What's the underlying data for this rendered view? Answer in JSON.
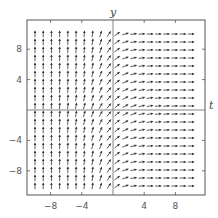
{
  "chart_data": {
    "type": "vector_field",
    "title": "",
    "xlabel": "t",
    "ylabel": "y",
    "xlim": [
      -11,
      11
    ],
    "ylim": [
      -11,
      11
    ],
    "xticks": [
      -8,
      -4,
      4,
      8
    ],
    "yticks": [
      -8,
      -4,
      4,
      8
    ],
    "xtick_labels": [
      "−8",
      "−4",
      "4",
      "8"
    ],
    "ytick_labels": [
      "−8",
      "−4",
      "4",
      "8"
    ],
    "grid": false,
    "legend": null,
    "field_description": "Slope/direction field: arrows nearly vertical (pointing up) for t < 0 far from y = 0, diagonal near t ≈ 0 and near y ≈ 0, nearly horizontal (pointing right) for t > 0 far from y = 0.",
    "arrow_grid": {
      "t_min": -10,
      "t_max": 10,
      "y_min": -10,
      "y_max": 10,
      "count_t": 20,
      "count_y": 20
    },
    "arrow_color": "#333333",
    "frame_color": "#555555"
  },
  "axes": {
    "x_label": "t",
    "y_label": "y"
  }
}
